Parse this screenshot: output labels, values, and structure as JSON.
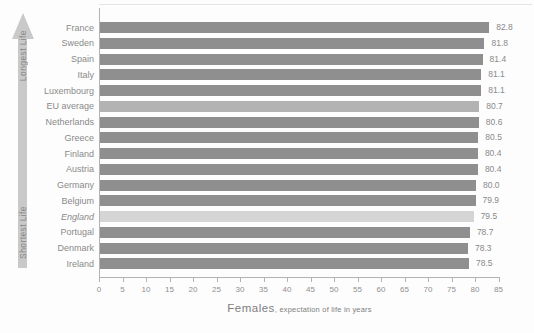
{
  "colors": {
    "bar_default": "#8f8f8f",
    "bar_eu_average": "#b3b3b3",
    "bar_england": "#d5d5d5",
    "axis": "#b3b3b3",
    "text_gray": "#8a8a8a",
    "arrow": "#c9c9c9"
  },
  "arrow": {
    "top_label": "Longest Life",
    "bottom_label": "Shortest Life"
  },
  "axis": {
    "label_main": "Females",
    "label_sub": ", expectation of life in years"
  },
  "chart_data": {
    "type": "bar",
    "orientation": "horizontal",
    "title": "",
    "xlabel": "Females, expectation of life in years",
    "ylabel": "",
    "xlim": [
      0,
      85
    ],
    "x_ticks": [
      0,
      5,
      10,
      15,
      20,
      25,
      30,
      35,
      40,
      45,
      50,
      55,
      60,
      65,
      70,
      75,
      80,
      85
    ],
    "grid": false,
    "legend": "none",
    "categories": [
      "France",
      "Sweden",
      "Spain",
      "Italy",
      "Luxembourg",
      "EU average",
      "Netherlands",
      "Greece",
      "Finland",
      "Austria",
      "Germany",
      "Belgium",
      "England",
      "Portugal",
      "Denmark",
      "Ireland"
    ],
    "values": [
      82.8,
      81.8,
      81.4,
      81.1,
      81.1,
      80.7,
      80.6,
      80.5,
      80.4,
      80.4,
      80.0,
      79.9,
      79.5,
      78.7,
      78.3,
      78.5
    ],
    "value_labels": [
      "82.8",
      "81.8",
      "81.4",
      "81.1",
      "81.1",
      "80.7",
      "80.6",
      "80.5",
      "80.4",
      "80.4",
      "80.0",
      "79.9",
      "79.5",
      "78.7",
      "78.3",
      "78.5"
    ],
    "bar_styles": [
      "default",
      "default",
      "default",
      "default",
      "default",
      "eu_average",
      "default",
      "default",
      "default",
      "default",
      "default",
      "default",
      "england",
      "default",
      "default",
      "default"
    ],
    "italic_categories": [
      "England"
    ],
    "sort_annotation": {
      "top": "Longest Life",
      "bottom": "Shortest Life"
    }
  }
}
